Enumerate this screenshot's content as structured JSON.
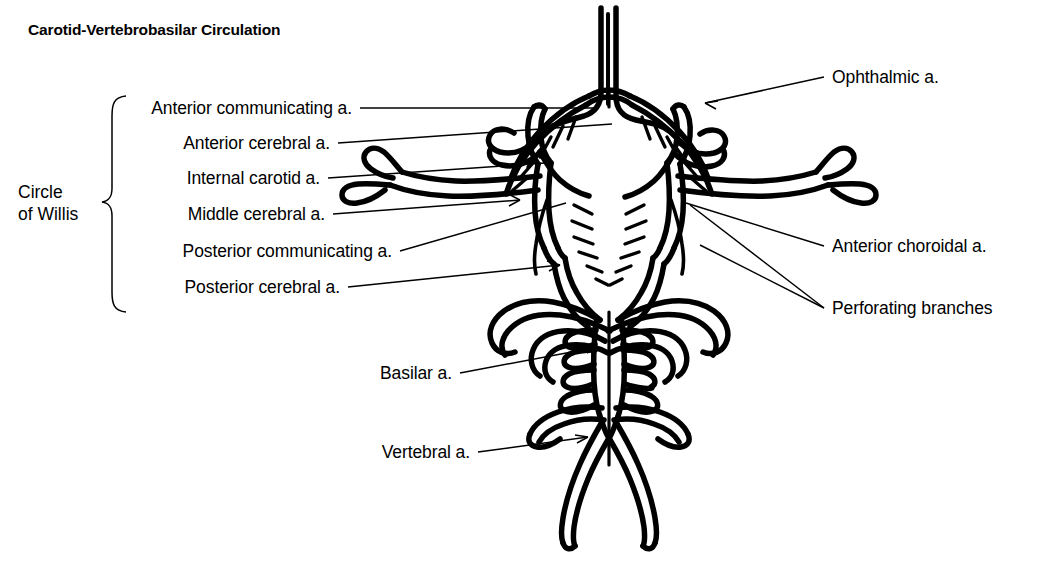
{
  "figure": {
    "title": "Carotid-Vertebrobasilar Circulation",
    "group_bracket_label_line1": "Circle",
    "group_bracket_label_line2": "of Willis",
    "ink_color": "#000000",
    "background_color": "#ffffff"
  },
  "labels": {
    "left": [
      {
        "id": "anterior-communicating",
        "text": "Anterior communicating a.",
        "right_x": 352,
        "baseline_y": 113
      },
      {
        "id": "anterior-cerebral",
        "text": "Anterior cerebral a.",
        "right_x": 330,
        "baseline_y": 148
      },
      {
        "id": "internal-carotid",
        "text": "Internal carotid a.",
        "right_x": 320,
        "baseline_y": 183
      },
      {
        "id": "middle-cerebral",
        "text": "Middle cerebral a.",
        "right_x": 325,
        "baseline_y": 219
      },
      {
        "id": "posterior-communicating",
        "text": "Posterior communicating a.",
        "right_x": 392,
        "baseline_y": 256
      },
      {
        "id": "posterior-cerebral",
        "text": "Posterior cerebral a.",
        "right_x": 340,
        "baseline_y": 292
      }
    ],
    "right": [
      {
        "id": "ophthalmic",
        "text": "Ophthalmic a.",
        "left_x": 832,
        "baseline_y": 82
      },
      {
        "id": "anterior-choroidal",
        "text": "Anterior choroidal a.",
        "left_x": 832,
        "baseline_y": 251
      },
      {
        "id": "perforating-branches",
        "text": "Perforating branches",
        "left_x": 832,
        "baseline_y": 313
      }
    ],
    "bottom": [
      {
        "id": "basilar",
        "text": "Basilar a.",
        "right_x": 452,
        "baseline_y": 378
      },
      {
        "id": "vertebral",
        "text": "Vertebral a.",
        "right_x": 470,
        "baseline_y": 457
      }
    ]
  },
  "anatomy": {
    "structures": [
      "anterior cerebral arteries (ascending paired trunk)",
      "anterior communicating artery",
      "internal carotid arteries",
      "middle cerebral arteries with bifurcating lateral tips",
      "ophthalmic arteries",
      "anterior choroidal arteries",
      "posterior communicating arteries",
      "posterior cerebral arteries",
      "perforating branches (radiating hatch marks)",
      "basilar artery with pontine branches",
      "vertebral arteries (paired, Y-shaped junction)"
    ],
    "view": "inferior view of the cerebral arterial circle",
    "symmetry": "bilaterally symmetric about the vertical midline"
  }
}
